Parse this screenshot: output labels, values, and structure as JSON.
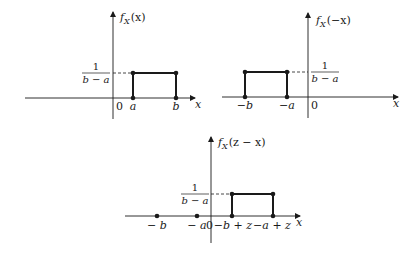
{
  "diagram": {
    "panels": [
      {
        "id": "fx",
        "function_label": "f_X(x)",
        "function_name": "f",
        "function_subscript": "X",
        "function_arg": "(x)",
        "height_label": {
          "numerator": "1",
          "denominator": "b − a"
        },
        "x_axis_label": "x",
        "origin_label": "0",
        "tick_labels": [
          "a",
          "b"
        ],
        "interval": [
          "a",
          "b"
        ]
      },
      {
        "id": "f_neg_x",
        "function_label": "f_X(−x)",
        "function_name": "f",
        "function_subscript": "X",
        "function_arg": "(−x)",
        "height_label": {
          "numerator": "1",
          "denominator": "b − a"
        },
        "x_axis_label": "x",
        "origin_label": "0",
        "tick_labels": [
          "−b",
          "−a"
        ],
        "interval": [
          "−b",
          "−a"
        ]
      },
      {
        "id": "f_z_minus_x",
        "function_label": "f_X(z − x)",
        "function_name": "f",
        "function_subscript": "X",
        "function_arg": "(z − x)",
        "height_label": {
          "numerator": "1",
          "denominator": "b − a"
        },
        "x_axis_label": "x",
        "origin_label": "0",
        "tick_labels": [
          "− b",
          "− a",
          "−b + z",
          "−a + z"
        ],
        "interval": [
          "−b + z",
          "−a + z"
        ]
      }
    ],
    "colors": {
      "ink": "#1a1a1a",
      "background": "#ffffff"
    }
  }
}
